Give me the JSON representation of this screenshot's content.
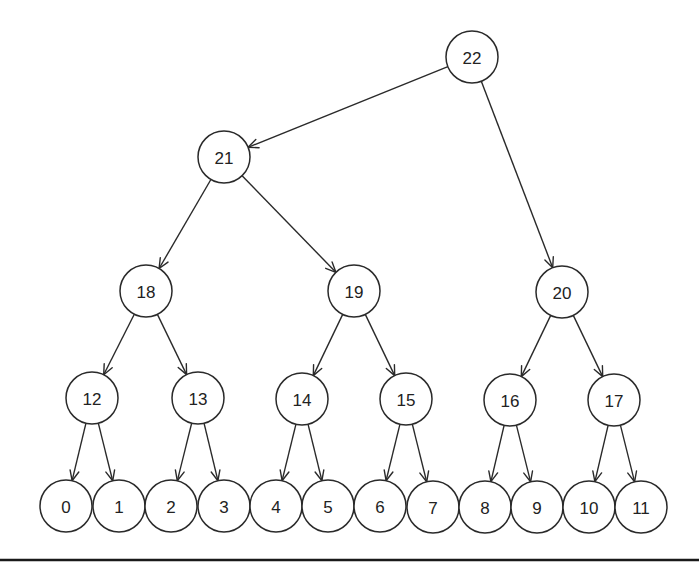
{
  "diagram": {
    "type": "tree",
    "node_radius": 26,
    "colors": {
      "stroke": "#2a2a2a",
      "fill": "#ffffff",
      "text": "#222222",
      "rule": "#1a1a1a"
    },
    "nodes": [
      {
        "id": "22",
        "label": "22",
        "x": 472,
        "y": 57
      },
      {
        "id": "21",
        "label": "21",
        "x": 224,
        "y": 157
      },
      {
        "id": "18",
        "label": "18",
        "x": 146,
        "y": 291
      },
      {
        "id": "19",
        "label": "19",
        "x": 354,
        "y": 291
      },
      {
        "id": "20",
        "label": "20",
        "x": 562,
        "y": 292
      },
      {
        "id": "12",
        "label": "12",
        "x": 92,
        "y": 398
      },
      {
        "id": "13",
        "label": "13",
        "x": 198,
        "y": 398
      },
      {
        "id": "14",
        "label": "14",
        "x": 302,
        "y": 399
      },
      {
        "id": "15",
        "label": "15",
        "x": 406,
        "y": 399
      },
      {
        "id": "16",
        "label": "16",
        "x": 510,
        "y": 400
      },
      {
        "id": "17",
        "label": "17",
        "x": 614,
        "y": 400
      },
      {
        "id": "0",
        "label": "0",
        "x": 66,
        "y": 506
      },
      {
        "id": "1",
        "label": "1",
        "x": 119,
        "y": 506
      },
      {
        "id": "2",
        "label": "2",
        "x": 171,
        "y": 506
      },
      {
        "id": "3",
        "label": "3",
        "x": 224,
        "y": 506
      },
      {
        "id": "4",
        "label": "4",
        "x": 276,
        "y": 506
      },
      {
        "id": "5",
        "label": "5",
        "x": 328,
        "y": 506
      },
      {
        "id": "6",
        "label": "6",
        "x": 380,
        "y": 506
      },
      {
        "id": "7",
        "label": "7",
        "x": 433,
        "y": 507
      },
      {
        "id": "8",
        "label": "8",
        "x": 485,
        "y": 507
      },
      {
        "id": "9",
        "label": "9",
        "x": 537,
        "y": 507
      },
      {
        "id": "10",
        "label": "10",
        "x": 589,
        "y": 507
      },
      {
        "id": "11",
        "label": "11",
        "x": 641,
        "y": 507
      }
    ],
    "edges": [
      {
        "from": "22",
        "to": "21"
      },
      {
        "from": "22",
        "to": "20"
      },
      {
        "from": "21",
        "to": "18"
      },
      {
        "from": "21",
        "to": "19"
      },
      {
        "from": "18",
        "to": "12"
      },
      {
        "from": "18",
        "to": "13"
      },
      {
        "from": "19",
        "to": "14"
      },
      {
        "from": "19",
        "to": "15"
      },
      {
        "from": "20",
        "to": "16"
      },
      {
        "from": "20",
        "to": "17"
      },
      {
        "from": "12",
        "to": "0"
      },
      {
        "from": "12",
        "to": "1"
      },
      {
        "from": "13",
        "to": "2"
      },
      {
        "from": "13",
        "to": "3"
      },
      {
        "from": "14",
        "to": "4"
      },
      {
        "from": "14",
        "to": "5"
      },
      {
        "from": "15",
        "to": "6"
      },
      {
        "from": "15",
        "to": "7"
      },
      {
        "from": "16",
        "to": "8"
      },
      {
        "from": "16",
        "to": "9"
      },
      {
        "from": "17",
        "to": "10"
      },
      {
        "from": "17",
        "to": "11"
      }
    ],
    "rule": {
      "x1": 0,
      "x2": 699,
      "y": 560
    }
  }
}
